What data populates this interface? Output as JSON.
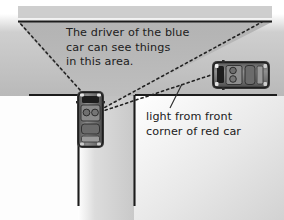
{
  "diagram": {
    "annotations": {
      "visibility_note": "The driver of the blue\ncar can see things\nin this area.",
      "light_note": "light from front\ncorner of red car"
    },
    "vehicles": [
      {
        "id": "blue-car",
        "label": "blue car",
        "orientation": "vertical",
        "position": "stopped at intersection, side road",
        "body_color": "#6e6e6e",
        "outline_color": "#2a2a2a"
      },
      {
        "id": "red-car",
        "label": "red car",
        "orientation": "horizontal",
        "position": "approaching on main road from the right",
        "body_color": "#7a7a7a",
        "outline_color": "#2a2a2a"
      }
    ],
    "sight_lines": [
      {
        "id": "left-sight-line",
        "style": "dotted",
        "from": "blue car driver",
        "to": "upper-left road edge"
      },
      {
        "id": "right-sight-line",
        "style": "dotted",
        "from": "blue car driver",
        "to": "upper-right road edge"
      },
      {
        "id": "light-ray",
        "style": "dotted",
        "from": "front corner of red car",
        "to": "blue car driver"
      }
    ],
    "regions": [
      {
        "id": "visible-cone",
        "label": "area the blue car driver can see",
        "fill": "#b4b4b4"
      },
      {
        "id": "road-surface",
        "label": "road surface",
        "fill": "#d4d4d4"
      },
      {
        "id": "background",
        "label": "background",
        "fill": "#ffffff"
      }
    ],
    "colors": {
      "cone_fill": "#b4b4b4",
      "road_fill": "#d8d8d8",
      "road_edge": "#1c1c1c",
      "text": "#202020",
      "dotted_line": "#222222",
      "leader_line": "#2a2a2a"
    }
  }
}
